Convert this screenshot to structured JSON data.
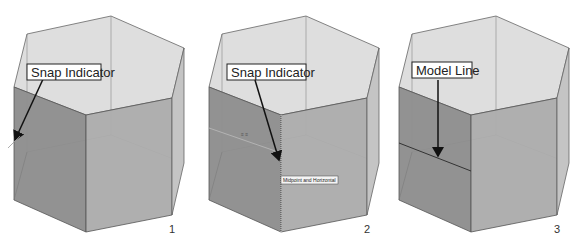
{
  "panels": [
    {
      "number": "1",
      "callout": "Snap Indicator"
    },
    {
      "number": "2",
      "callout": "Snap Indicator",
      "tooltip": "Midpoint and Horizontal"
    },
    {
      "number": "3",
      "callout": "Model Line"
    }
  ],
  "colors": {
    "top_face": "#dcdcdc",
    "left_face": "#8a8a8a",
    "front_face": "#a8a8a8",
    "edge": "#555555"
  }
}
